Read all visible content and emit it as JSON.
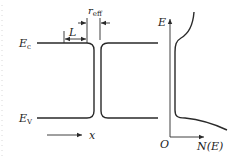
{
  "diagram": {
    "title": "",
    "labels": {
      "conduction_band": "E",
      "conduction_band_sub": "c",
      "valence_band": "E",
      "valence_band_sub": "V",
      "length": "L",
      "r_eff": "r",
      "r_eff_sub": "eff",
      "x_axis": "x",
      "energy_axis": "E",
      "origin": "O",
      "dos_axis": "N(E)"
    },
    "colors": {
      "line": "#2a2a2a",
      "text": "#222222",
      "background": "#ffffff"
    }
  }
}
